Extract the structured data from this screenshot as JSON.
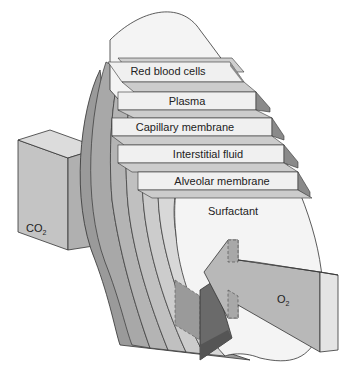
{
  "layers": [
    {
      "label": "Red blood cells"
    },
    {
      "label": "Plasma"
    },
    {
      "label": "Capillary membrane"
    },
    {
      "label": "Interstitial fluid"
    },
    {
      "label": "Alveolar membrane"
    },
    {
      "label": "Surfactant"
    }
  ],
  "gases": {
    "co2": {
      "base": "CO",
      "sub": "2"
    },
    "o2": {
      "base": "O",
      "sub": "2"
    }
  },
  "colors": {
    "layer_fill": "#f2f2f2",
    "step_top": "#cfcfcf",
    "step_side": "#8a8a8a",
    "band_dark": "#a8a8a8",
    "band_light": "#d6d6d6",
    "arrow": "#b8b8b8",
    "arrow_dark": "#6a6a6a"
  }
}
